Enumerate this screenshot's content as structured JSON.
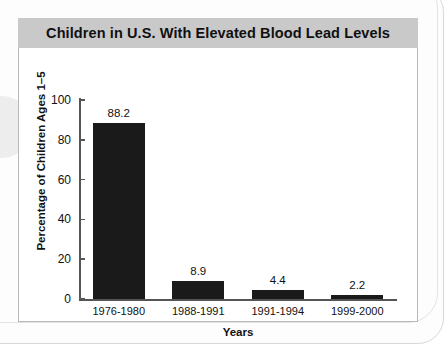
{
  "chart_data": {
    "type": "bar",
    "title": "Children in U.S. With Elevated Blood Lead Levels",
    "xlabel": "Years",
    "ylabel": "Percentage of Children Ages 1–5",
    "categories": [
      "1976-1980",
      "1988-1991",
      "1991-1994",
      "1999-2000"
    ],
    "values": [
      88.2,
      8.9,
      4.4,
      2.2
    ],
    "value_labels": [
      "88.2",
      "8.9",
      "4.4",
      "2.2"
    ],
    "ylim": [
      0,
      100
    ],
    "yticks": [
      0,
      20,
      40,
      60,
      80,
      100
    ],
    "ytick_labels": [
      "0",
      "20",
      "40",
      "60",
      "80",
      "100"
    ],
    "grid": false,
    "legend": "none",
    "bar_color": "#1a1a1a",
    "title_band_color": "#c9c9c9",
    "axis_color": "#555555",
    "panel_background": "#ffffff"
  }
}
